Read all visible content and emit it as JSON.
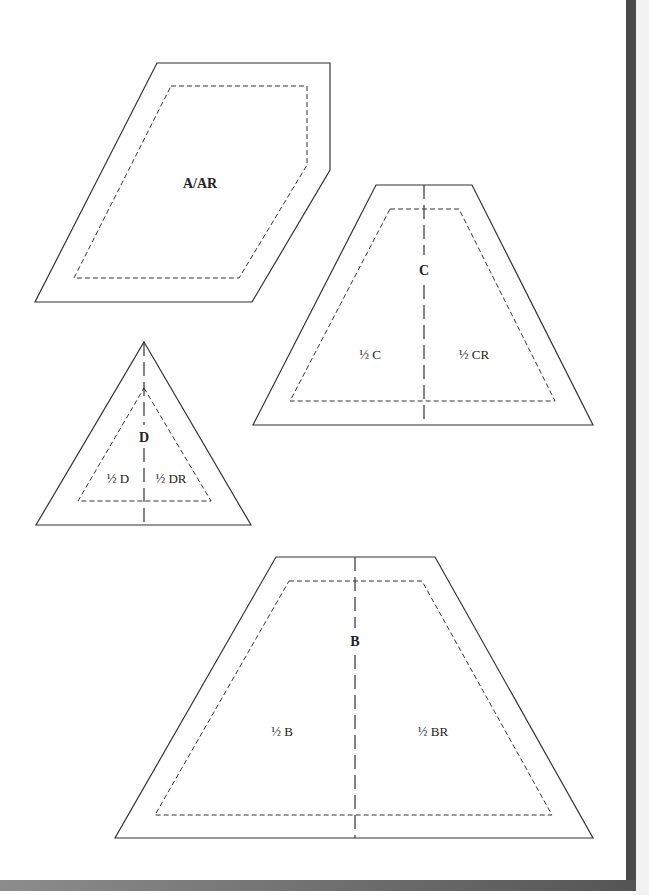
{
  "page": {
    "type": "quilt template sheet",
    "background": "#ffffff",
    "border_color": "#4a4a4a"
  },
  "pieces": {
    "a": {
      "label": "A/AR",
      "outer": "157,63 330,63 330,170 252,302 35,302",
      "inner": "171,86 307,86 307,165 239,278 74,278",
      "label_pos": [
        200,
        188
      ]
    },
    "c": {
      "label": "C",
      "half_left": "½ C",
      "half_right": "½ CR",
      "outer": "376,185 472,185 593,425 253,425",
      "inner": "390,209 459,209 555,401 290,401",
      "grain_x": 424,
      "grain_y": [
        185,
        425
      ]
    },
    "d": {
      "label": "D",
      "half_left": "½ D",
      "half_right": "½ DR",
      "outer": "144,342 251,525 36,525",
      "inner": "144,388 211,501 78,501",
      "grain_x": 144,
      "grain_y": [
        342,
        525
      ]
    },
    "b": {
      "label": "B",
      "half_left": "½ B",
      "half_right": "½ BR",
      "outer": "276,557 435,557 593,838 115,838",
      "inner": "289,581 422,581 552,815 155,815",
      "grain_x": 355,
      "grain_y": [
        557,
        838
      ]
    }
  }
}
